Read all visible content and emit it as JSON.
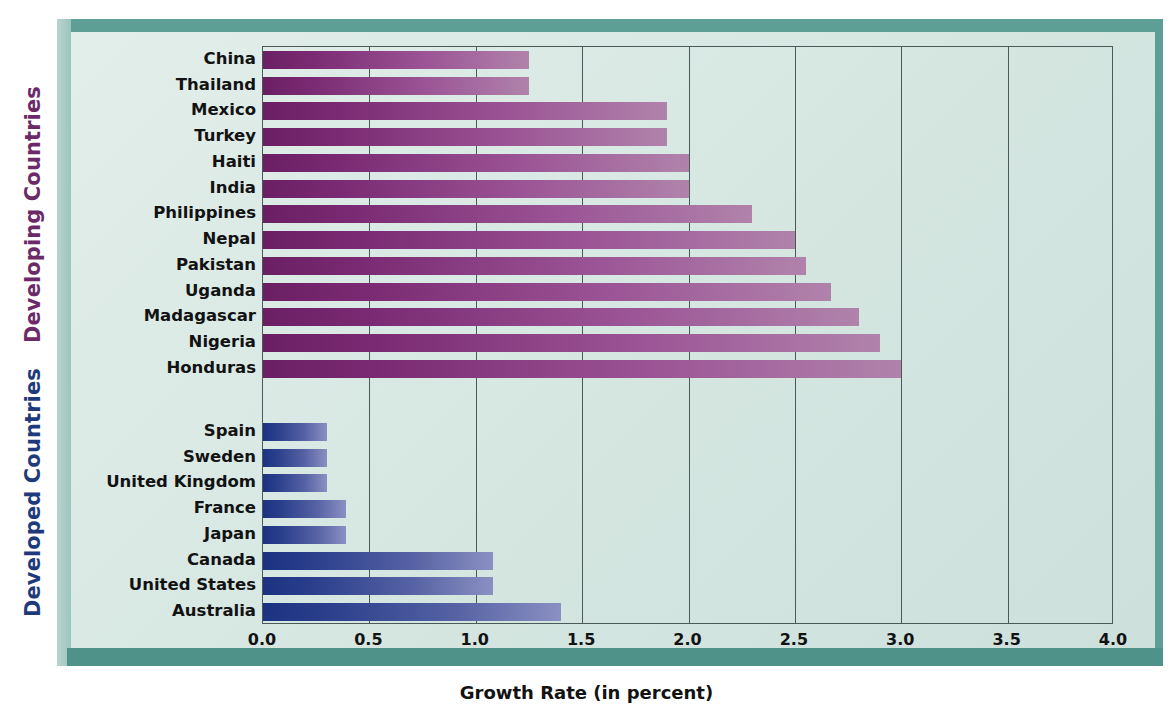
{
  "groups": {
    "developing_label": "Developing Countries",
    "developed_label": "Developed Countries",
    "developing_color": "#6b2a67",
    "developed_color": "#1f3a7a"
  },
  "axis": {
    "title": "Growth Rate (in percent)",
    "ticks": [
      "0.0",
      "0.5",
      "1.0",
      "1.5",
      "2.0",
      "2.5",
      "3.0",
      "3.5",
      "4.0"
    ]
  },
  "chart_data": {
    "type": "bar",
    "orientation": "horizontal",
    "title": "",
    "xlabel": "Growth Rate (in percent)",
    "ylabel": "",
    "xlim": [
      0,
      4
    ],
    "xticks": [
      0,
      0.5,
      1,
      1.5,
      2,
      2.5,
      3,
      3.5,
      4
    ],
    "grid": true,
    "legend": false,
    "groups": [
      {
        "name": "Developing Countries",
        "color": "#7a2a72",
        "categories": [
          "China",
          "Thailand",
          "Mexico",
          "Turkey",
          "Haiti",
          "India",
          "Philippines",
          "Nepal",
          "Pakistan",
          "Uganda",
          "Madagascar",
          "Nigeria",
          "Honduras"
        ],
        "values": [
          1.25,
          1.25,
          1.9,
          1.9,
          2.0,
          2.0,
          2.3,
          2.5,
          2.55,
          2.67,
          2.8,
          2.9,
          3.0
        ]
      },
      {
        "name": "Developed Countries",
        "color": "#2b3f8c",
        "categories": [
          "Spain",
          "Sweden",
          "United Kingdom",
          "France",
          "Japan",
          "Canada",
          "United States",
          "Australia"
        ],
        "values": [
          0.3,
          0.3,
          0.3,
          0.39,
          0.39,
          1.08,
          1.08,
          1.4
        ]
      }
    ]
  }
}
